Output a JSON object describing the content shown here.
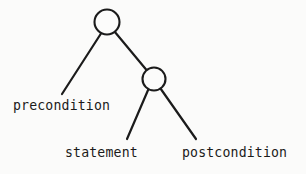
{
  "diagram": {
    "type": "parse-tree",
    "background_color": "#fbfbfa",
    "stroke_color": "#1b1b1b",
    "node_fill_color": "#fcfcfb",
    "nodes": [
      {
        "id": "root",
        "label": "",
        "cx": 107,
        "cy": 22,
        "r": 12.5
      },
      {
        "id": "inner",
        "label": "",
        "cx": 154,
        "cy": 79,
        "r": 11.5
      }
    ],
    "edges": [
      {
        "id": "root-to-precondition",
        "x1": 101,
        "y1": 33.5,
        "x2": 62,
        "y2": 94
      },
      {
        "id": "root-to-inner",
        "x1": 114.5,
        "y1": 31.5,
        "x2": 146.5,
        "y2": 70
      },
      {
        "id": "inner-to-statement",
        "x1": 148.5,
        "y1": 89,
        "x2": 127,
        "y2": 139
      },
      {
        "id": "inner-to-postcondition",
        "x1": 160.5,
        "y1": 88.5,
        "x2": 196,
        "y2": 139
      }
    ],
    "labels": {
      "precondition": "precondition",
      "statement": "statement",
      "postcondition": "postcondition"
    }
  }
}
